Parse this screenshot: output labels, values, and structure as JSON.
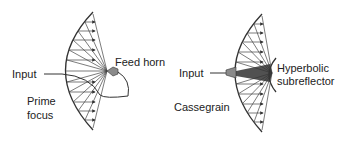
{
  "diagrams": [
    {
      "name": "prime-focus",
      "labels": {
        "input": "Input",
        "feed": "Feed horn",
        "type_line1": "Prime",
        "type_line2": "focus"
      }
    },
    {
      "name": "cassegrain",
      "labels": {
        "input": "Input",
        "sub_line1": "Hyperbolic",
        "sub_line2": "subreflector",
        "type": "Cassegrain"
      }
    }
  ],
  "colors": {
    "line": "#333333",
    "horn": "#8a8a8a",
    "background": "#ffffff"
  }
}
